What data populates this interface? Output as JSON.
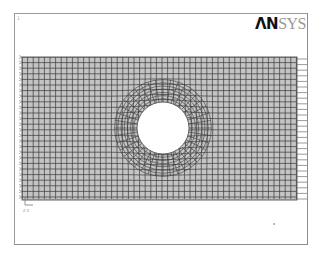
{
  "window": {
    "number_label": "1",
    "logo_bold": "ΛN",
    "logo_light": "SYS"
  },
  "plot": {
    "type": "finite-element mesh",
    "description": "Rectangular plate with central circular hole, quadrilateral element mesh",
    "mesh_bounds": {
      "x0": 22,
      "y0": 57,
      "x1": 297,
      "y1": 200
    },
    "hole": {
      "cx": 163,
      "cy": 128,
      "r": 26
    },
    "element_size_px": 5.6,
    "colors": {
      "mesh_fill": "#c4c4c4",
      "mesh_line": "#3a3a3a",
      "frame": "#9a9a9a",
      "load_marker": "#555555",
      "constraint_marker": "#777777"
    },
    "constraints_side": "left",
    "loads_side": "right",
    "triad_label": "Z X"
  }
}
